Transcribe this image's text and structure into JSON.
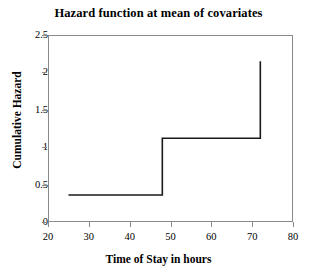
{
  "chart_data": {
    "type": "line",
    "subtype": "step",
    "title": "Hazard function at mean of covariates",
    "xlabel": "Time of Stay in hours",
    "ylabel": "Cumulative Hazard",
    "xlim": [
      20,
      80
    ],
    "ylim": [
      0,
      2.5
    ],
    "grid": false,
    "legend": null,
    "xticks": [
      20,
      30,
      40,
      50,
      60,
      70,
      80
    ],
    "xtick_labels": [
      "20",
      "30",
      "40",
      "50",
      "60",
      "70",
      "80"
    ],
    "yticks": [
      0,
      0.5,
      1,
      1.5,
      2,
      2.5
    ],
    "ytick_labels": [
      "0",
      "0.5",
      "1",
      "1.5",
      "2",
      "2.5"
    ],
    "series": [
      {
        "name": "Cumulative Hazard",
        "color": "#1a1a1a",
        "line_width": 1.6,
        "x": [
          25,
          48,
          48,
          72,
          72
        ],
        "y": [
          0.36,
          0.36,
          1.12,
          1.12,
          2.15
        ],
        "steps": [
          {
            "start_x": 25,
            "end_x": 48,
            "value": 0.36
          },
          {
            "start_x": 48,
            "end_x": 72,
            "value": 1.12
          },
          {
            "start_x": 72,
            "end_x": 72,
            "value": 2.15
          }
        ]
      }
    ]
  },
  "style": {
    "frame_color": "#8a8a8a",
    "line_color": "#1a1a1a",
    "background": "#ffffff"
  }
}
